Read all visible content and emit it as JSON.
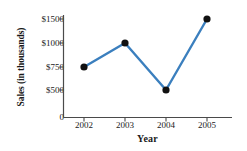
{
  "chart_data": {
    "type": "line",
    "title": "",
    "xlabel": "Year",
    "ylabel": "Sales (in thousands)",
    "categories": [
      "2002",
      "2003",
      "2004",
      "2005"
    ],
    "x": [
      2002,
      2003,
      2004,
      2005
    ],
    "values": [
      750,
      1000,
      500,
      1500
    ],
    "series": [
      {
        "name": "Sales",
        "values": [
          750,
          1000,
          500,
          1500
        ]
      }
    ],
    "point_labels": [
      "$750",
      "$1000",
      "$500",
      "$1500"
    ],
    "y_tick_labels": [
      "$1500",
      "$1000",
      "$750",
      "$500",
      "0"
    ],
    "y_tick_values": [
      1500,
      1000,
      750,
      500,
      0
    ],
    "y_axis_scale": "non-linear (equally spaced ticks)",
    "x_tick_labels": [
      "2002",
      "2003",
      "2004",
      "2005"
    ],
    "xlim": [
      2001.6,
      2005.9
    ],
    "ylim": [
      0,
      1500
    ],
    "grid": false,
    "legend": false,
    "legend_position": "none",
    "line_color": "#3b7fbe",
    "marker_color": "#111111",
    "marker_shape": "circle",
    "axis_color": "#4a4a4a"
  }
}
